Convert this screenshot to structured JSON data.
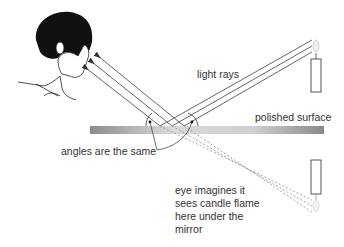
{
  "diagram": {
    "labels": {
      "light_rays": "light rays",
      "polished_surface": "polished surface",
      "angles_same": "angles are the same",
      "eye_imagines": [
        "eye imagines it",
        "sees candle flame",
        "here under the",
        "mirror"
      ]
    },
    "colors": {
      "ray": "#555555",
      "mirror_light": "#e0e0e0",
      "mirror_dark": "#8a8a8a",
      "text": "#333333"
    }
  }
}
